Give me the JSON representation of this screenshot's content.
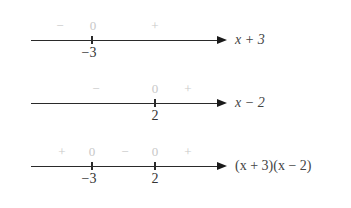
{
  "diagram": {
    "rows": [
      {
        "expression": "x + 3",
        "ticks": [
          {
            "value": "−3",
            "x": 92
          }
        ],
        "signs": [
          {
            "symbol": "−",
            "x": 60
          },
          {
            "symbol": "0",
            "x": 93
          },
          {
            "symbol": "+",
            "x": 155
          }
        ]
      },
      {
        "expression": "x − 2",
        "ticks": [
          {
            "value": "2",
            "x": 155
          }
        ],
        "signs": [
          {
            "symbol": "−",
            "x": 96
          },
          {
            "symbol": "0",
            "x": 155
          },
          {
            "symbol": "+",
            "x": 188
          }
        ]
      },
      {
        "expression": "(x + 3)(x − 2)",
        "ticks": [
          {
            "value": "−3",
            "x": 92
          },
          {
            "value": "2",
            "x": 155
          }
        ],
        "signs": [
          {
            "symbol": "+",
            "x": 62
          },
          {
            "symbol": "0",
            "x": 92
          },
          {
            "symbol": "−",
            "x": 125
          },
          {
            "symbol": "0",
            "x": 155
          },
          {
            "symbol": "+",
            "x": 188
          }
        ]
      }
    ]
  }
}
